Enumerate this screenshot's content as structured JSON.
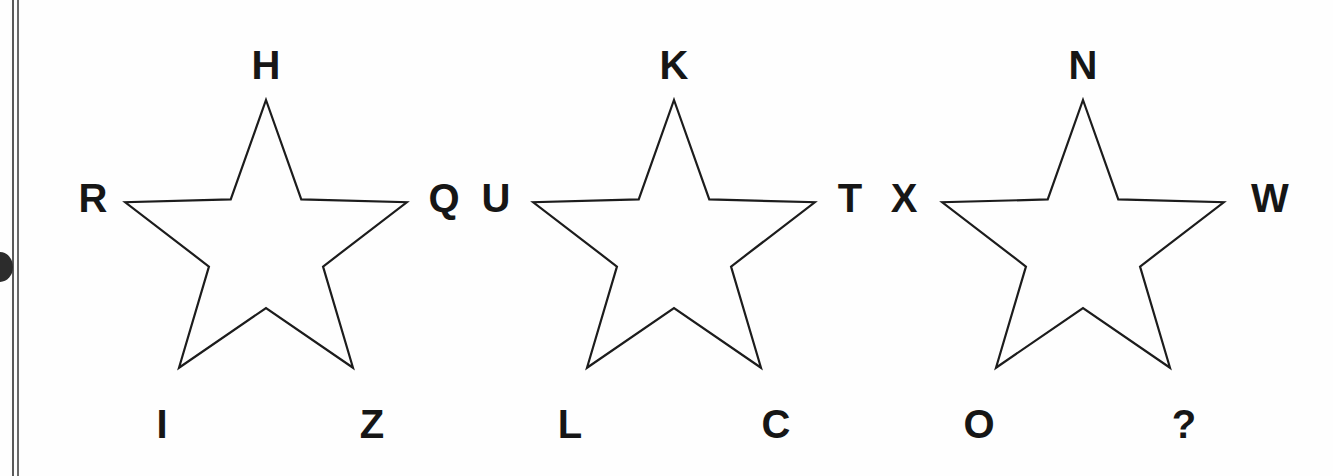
{
  "page": {
    "background_color": "#fefefe",
    "ink_color": "#161616",
    "stroke_color": "#1c1c1c",
    "artifact_color": "#2c2c2c",
    "binding_rule_color": "#5a5a5a"
  },
  "figure": {
    "kind": "five-pointed-star-diagrams",
    "star_count": 3,
    "answer_marker": "?"
  },
  "stars": [
    {
      "id": "star-1",
      "center": {
        "x": 266,
        "y": 248
      },
      "outer_radius": 148,
      "inner_radius": 60,
      "vertices": [
        {
          "id": "s1-top",
          "label": "H",
          "x": 266,
          "y": 65,
          "anchor": "center"
        },
        {
          "id": "s1-left",
          "label": "R",
          "x": 93,
          "y": 198,
          "anchor": "center"
        },
        {
          "id": "s1-right",
          "label": "Q",
          "x": 444,
          "y": 198,
          "anchor": "center"
        },
        {
          "id": "s1-bottom-left",
          "label": "I",
          "x": 162,
          "y": 424,
          "anchor": "center"
        },
        {
          "id": "s1-bottom-right",
          "label": "Z",
          "x": 372,
          "y": 424,
          "anchor": "center"
        }
      ]
    },
    {
      "id": "star-2",
      "center": {
        "x": 674,
        "y": 248
      },
      "outer_radius": 148,
      "inner_radius": 60,
      "vertices": [
        {
          "id": "s2-top",
          "label": "K",
          "x": 674,
          "y": 65,
          "anchor": "center"
        },
        {
          "id": "s2-left",
          "label": "U",
          "x": 496,
          "y": 198,
          "anchor": "center"
        },
        {
          "id": "s2-right",
          "label": "T",
          "x": 850,
          "y": 198,
          "anchor": "center"
        },
        {
          "id": "s2-bottom-left",
          "label": "L",
          "x": 570,
          "y": 424,
          "anchor": "center"
        },
        {
          "id": "s2-bottom-right",
          "label": "C",
          "x": 776,
          "y": 424,
          "anchor": "center"
        }
      ]
    },
    {
      "id": "star-3",
      "center": {
        "x": 1083,
        "y": 248
      },
      "outer_radius": 148,
      "inner_radius": 60,
      "vertices": [
        {
          "id": "s3-top",
          "label": "N",
          "x": 1083,
          "y": 65,
          "anchor": "center"
        },
        {
          "id": "s3-left",
          "label": "X",
          "x": 904,
          "y": 198,
          "anchor": "center"
        },
        {
          "id": "s3-right",
          "label": "W",
          "x": 1270,
          "y": 198,
          "anchor": "center"
        },
        {
          "id": "s3-bottom-left",
          "label": "O",
          "x": 979,
          "y": 424,
          "anchor": "center"
        },
        {
          "id": "s3-bottom-right",
          "label": "?",
          "x": 1184,
          "y": 424,
          "anchor": "center"
        }
      ]
    }
  ],
  "chart_data": {
    "type": "diagram",
    "title": "",
    "series": [
      {
        "name": "star-1",
        "points": [
          "H",
          "Q",
          "Z",
          "I",
          "R"
        ]
      },
      {
        "name": "star-2",
        "points": [
          "K",
          "T",
          "C",
          "L",
          "U"
        ]
      },
      {
        "name": "star-3",
        "points": [
          "N",
          "W",
          "?",
          "O",
          "X"
        ]
      }
    ],
    "point_order": [
      "top",
      "right",
      "bottom-right",
      "bottom-left",
      "left"
    ]
  }
}
